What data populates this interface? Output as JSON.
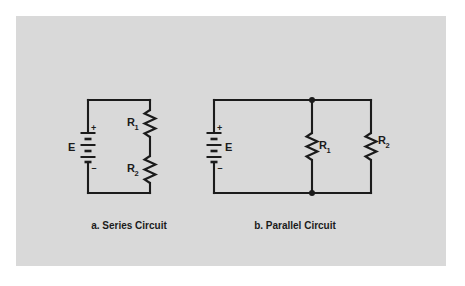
{
  "figure": {
    "background_color": "#ffffff",
    "panel_color": "#d9d9d9",
    "ink_color": "#1b1b1b"
  },
  "circuits": [
    {
      "id": "series",
      "caption": "a. Series Circuit",
      "source": {
        "label": "E",
        "plus_sign": "+",
        "minus_sign": "–",
        "label_side": "left",
        "component": "battery"
      },
      "resistors": [
        {
          "label": "R",
          "subscript": "1",
          "label_side": "left",
          "position": "upper-right-branch"
        },
        {
          "label": "R",
          "subscript": "2",
          "label_side": "left",
          "position": "lower-right-branch"
        }
      ],
      "junction_dots": 0
    },
    {
      "id": "parallel",
      "caption": "b. Parallel Circuit",
      "source": {
        "label": "E",
        "plus_sign": "+",
        "minus_sign": "–",
        "label_side": "right",
        "component": "battery"
      },
      "resistors": [
        {
          "label": "R",
          "subscript": "1",
          "label_side": "right",
          "position": "middle-branch"
        },
        {
          "label": "R",
          "subscript": "2",
          "label_side": "right",
          "position": "right-branch"
        }
      ],
      "junction_dots": 2
    }
  ]
}
